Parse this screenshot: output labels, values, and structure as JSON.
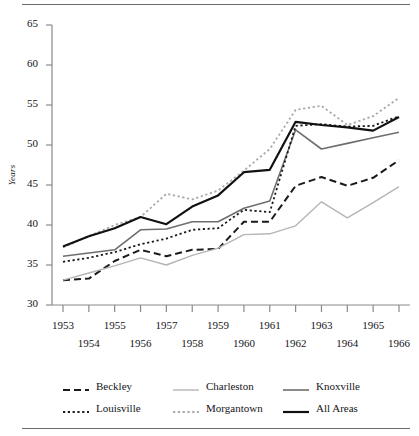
{
  "figure": {
    "rule_color": "#6b6b6b"
  },
  "axes": {
    "ylabel": "Years",
    "ytick_labels": [
      "65",
      "60",
      "55",
      "50",
      "45",
      "40",
      "35",
      "30"
    ],
    "xtick_labels_top": [
      "1953",
      "1955",
      "1957",
      "1959",
      "1961",
      "1963",
      "1965"
    ],
    "xtick_labels_bottom": [
      "1954",
      "1956",
      "1958",
      "1960",
      "1962",
      "1964",
      "1966"
    ]
  },
  "legend": {
    "entries": [
      {
        "label": "Beckley",
        "style": "dashed",
        "color": "#1a1a1a",
        "width": 2.0
      },
      {
        "label": "Charleston",
        "style": "solid",
        "color": "#b5b5b5",
        "width": 1.4
      },
      {
        "label": "Knoxville",
        "style": "solid",
        "color": "#6e6e6e",
        "width": 1.6
      },
      {
        "label": "Louisville",
        "style": "dotted",
        "color": "#1a1a1a",
        "width": 1.8
      },
      {
        "label": "Morgantown",
        "style": "dotted",
        "color": "#a8a8a8",
        "width": 1.8
      },
      {
        "label": "All Areas",
        "style": "solid",
        "color": "#111111",
        "width": 2.2
      }
    ]
  },
  "chart_data": {
    "type": "line",
    "title": "",
    "xlabel": "",
    "ylabel": "Years",
    "xlim": [
      1953,
      1966
    ],
    "ylim": [
      30,
      65
    ],
    "ytick_step": 5,
    "grid": false,
    "legend_position": "below",
    "x": [
      1953,
      1954,
      1955,
      1956,
      1957,
      1958,
      1959,
      1960,
      1961,
      1962,
      1963,
      1964,
      1965,
      1966
    ],
    "series": [
      {
        "name": "Beckley",
        "style": "dashed",
        "color": "#1a1a1a",
        "values": [
          33.1,
          33.3,
          35.5,
          36.9,
          36.1,
          36.9,
          37.0,
          40.4,
          40.4,
          44.9,
          46.0,
          44.9,
          45.9,
          48.1
        ]
      },
      {
        "name": "Charleston",
        "style": "solid",
        "color": "#b5b5b5",
        "values": [
          33.1,
          34.0,
          34.9,
          35.9,
          35.0,
          36.2,
          37.1,
          38.8,
          38.9,
          39.9,
          42.9,
          40.9,
          42.8,
          44.8
        ]
      },
      {
        "name": "Knoxville",
        "style": "solid",
        "color": "#6e6e6e",
        "values": [
          36.1,
          36.5,
          36.9,
          39.4,
          39.5,
          40.4,
          40.4,
          42.1,
          43.0,
          51.9,
          49.5,
          50.2,
          50.9,
          51.6
        ]
      },
      {
        "name": "Louisville",
        "style": "dotted",
        "color": "#1a1a1a",
        "values": [
          35.4,
          35.9,
          36.6,
          37.6,
          38.3,
          39.4,
          39.6,
          41.9,
          41.6,
          52.4,
          52.6,
          52.3,
          52.4,
          53.6
        ]
      },
      {
        "name": "Morgantown",
        "style": "dotted",
        "color": "#a8a8a8",
        "values": [
          37.2,
          38.6,
          40.0,
          41.0,
          43.9,
          43.2,
          44.3,
          46.8,
          49.5,
          54.4,
          54.9,
          52.5,
          53.6,
          55.9
        ]
      },
      {
        "name": "All Areas",
        "style": "solid",
        "color": "#111111",
        "values": [
          37.3,
          38.6,
          39.6,
          41.0,
          40.1,
          42.3,
          43.7,
          46.6,
          46.9,
          52.9,
          52.5,
          52.2,
          51.8,
          53.5
        ]
      }
    ]
  }
}
